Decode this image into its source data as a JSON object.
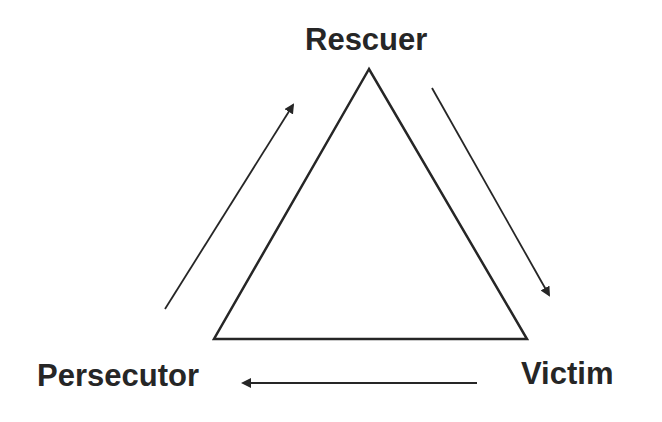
{
  "diagram": {
    "nodes": {
      "top": {
        "label": "Rescuer"
      },
      "bottom_left": {
        "label": "Persecutor"
      },
      "bottom_right": {
        "label": "Victim"
      }
    },
    "edges": [
      {
        "from": "Persecutor",
        "to": "Rescuer",
        "direction": "up-right"
      },
      {
        "from": "Rescuer",
        "to": "Victim",
        "direction": "down-right"
      },
      {
        "from": "Victim",
        "to": "Persecutor",
        "direction": "left"
      }
    ],
    "colors": {
      "stroke": "#262626",
      "text": "#262626",
      "background": "#ffffff"
    }
  }
}
